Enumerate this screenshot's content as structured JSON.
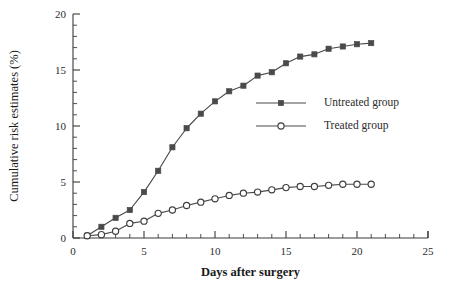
{
  "figure": {
    "background_color": "#ffffff",
    "line_color": "#4a4a4a",
    "text_color": "#2b2b2b"
  },
  "axis": {
    "x_title": "Days after surgery",
    "y_title": "Cumulative risk estimates (%)",
    "x_tick_labels": [
      "0",
      "5",
      "10",
      "15",
      "20",
      "25"
    ],
    "y_tick_labels": [
      "0",
      "5",
      "10",
      "15",
      "20"
    ]
  },
  "legend": {
    "items": [
      {
        "label": "Untreated group",
        "marker": "filled-square",
        "color": "#4a4a4a"
      },
      {
        "label": "Treated group",
        "marker": "open-circle",
        "color": "#4a4a4a"
      }
    ]
  },
  "chart_data": {
    "type": "line",
    "title": "",
    "subtitle": "",
    "xlabel": "Days after surgery",
    "ylabel": "Cumulative risk estimates (%)",
    "xlim": [
      0,
      25
    ],
    "ylim": [
      0,
      20
    ],
    "x_major_ticks": [
      0,
      5,
      10,
      15,
      20,
      25
    ],
    "y_major_ticks": [
      0,
      5,
      10,
      15,
      20
    ],
    "x_minor_tick_step": 1,
    "y_minor_tick_step": 1,
    "grid": false,
    "legend_position": "center-right",
    "x": [
      1,
      2,
      3,
      4,
      5,
      6,
      7,
      8,
      9,
      10,
      11,
      12,
      13,
      14,
      15,
      16,
      17,
      18,
      19,
      20,
      21
    ],
    "series": [
      {
        "name": "Untreated group",
        "marker": "filled-square",
        "color": "#4a4a4a",
        "values": [
          0.2,
          1.0,
          1.8,
          2.5,
          4.1,
          6.0,
          8.1,
          9.8,
          11.1,
          12.2,
          13.1,
          13.6,
          14.5,
          14.8,
          15.6,
          16.2,
          16.4,
          16.9,
          17.1,
          17.3,
          17.4
        ]
      },
      {
        "name": "Treated group",
        "marker": "open-circle",
        "color": "#4a4a4a",
        "values": [
          0.2,
          0.3,
          0.6,
          1.3,
          1.5,
          2.2,
          2.5,
          2.9,
          3.2,
          3.5,
          3.8,
          4.0,
          4.1,
          4.3,
          4.5,
          4.6,
          4.6,
          4.7,
          4.8,
          4.8,
          4.8
        ]
      }
    ]
  }
}
